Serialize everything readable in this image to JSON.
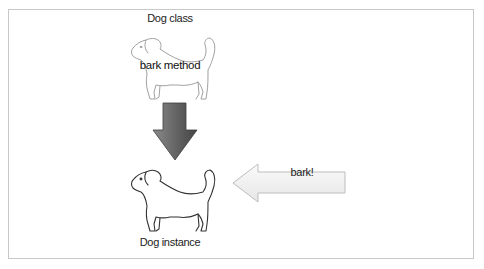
{
  "diagram": {
    "class_label": "Dog class",
    "method_label": "bark method",
    "instance_label": "Dog instance",
    "message_label": "bark!"
  },
  "nodes": [
    {
      "id": "dog-class",
      "label": "Dog class",
      "icon": "dog-outline-icon",
      "style": "faded"
    },
    {
      "id": "dog-instance",
      "label": "Dog instance",
      "icon": "dog-outline-icon",
      "style": "solid"
    }
  ],
  "edges": [
    {
      "from": "dog-class",
      "to": "dog-instance",
      "icon": "down-arrow-icon",
      "label": ""
    },
    {
      "from": "external",
      "to": "dog-instance",
      "icon": "left-arrow-icon",
      "label": "bark!"
    }
  ],
  "colors": {
    "frame_border": "#c8c8c8",
    "down_arrow_dark": "#555555",
    "down_arrow_light": "#8a8a8a",
    "left_arrow_fill": "#f2f2f2",
    "left_arrow_stroke": "#bdbdbd",
    "dog_faded": "#9a9a9a",
    "dog_solid": "#333333"
  }
}
